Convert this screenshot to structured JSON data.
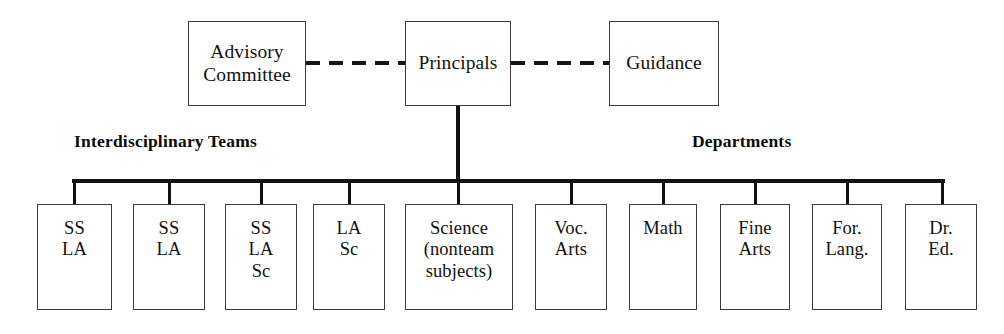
{
  "diagram": {
    "type": "org-chart",
    "line_color": "#111111",
    "box_border_color": "#3a3a3a",
    "background": "#ffffff"
  },
  "top_level": {
    "advisory": {
      "label": "Advisory\nCommittee"
    },
    "principals": {
      "label": "Principals"
    },
    "guidance": {
      "label": "Guidance"
    }
  },
  "section_captions": {
    "left": "Interdisciplinary Teams",
    "right": "Departments"
  },
  "units": [
    {
      "label": "SS\nLA"
    },
    {
      "label": "SS\nLA"
    },
    {
      "label": "SS\nLA\nSc"
    },
    {
      "label": "LA\nSc"
    },
    {
      "label": "Science\n(nonteam\nsubjects)"
    },
    {
      "label": "Voc.\nArts"
    },
    {
      "label": "Math"
    },
    {
      "label": "Fine\nArts"
    },
    {
      "label": "For.\nLang."
    },
    {
      "label": "Dr.\nEd."
    }
  ]
}
